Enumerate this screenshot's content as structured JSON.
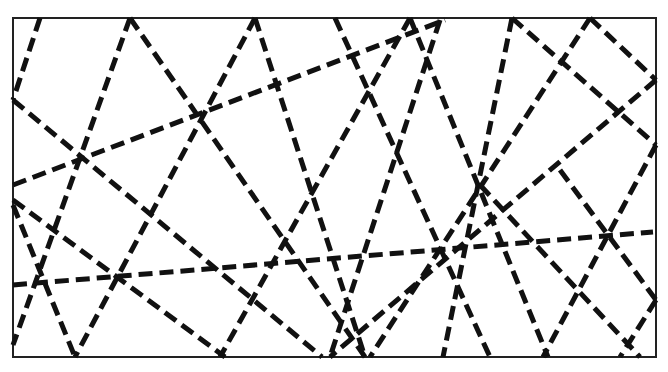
{
  "diagram": {
    "type": "line-arrangement",
    "frame": {
      "x": 13,
      "y": 18,
      "width": 643,
      "height": 339
    },
    "colors": {
      "line": "#111111",
      "frame": "#222222",
      "background": "#ffffff"
    },
    "segments": [
      [
        40,
        18,
        13,
        100
      ],
      [
        13,
        100,
        322,
        357
      ],
      [
        130,
        18,
        13,
        345
      ],
      [
        130,
        18,
        365,
        357
      ],
      [
        13,
        185,
        445,
        20
      ],
      [
        255,
        18,
        75,
        357
      ],
      [
        255,
        18,
        365,
        357
      ],
      [
        13,
        200,
        225,
        357
      ],
      [
        13,
        205,
        75,
        357
      ],
      [
        13,
        285,
        653,
        232
      ],
      [
        335,
        18,
        490,
        357
      ],
      [
        410,
        18,
        220,
        357
      ],
      [
        410,
        18,
        548,
        357
      ],
      [
        440,
        20,
        330,
        357
      ],
      [
        512,
        18,
        443,
        357
      ],
      [
        512,
        18,
        656,
        145
      ],
      [
        590,
        18,
        370,
        357
      ],
      [
        590,
        18,
        656,
        80
      ],
      [
        656,
        80,
        330,
        357
      ],
      [
        656,
        145,
        543,
        357
      ],
      [
        560,
        170,
        656,
        300
      ],
      [
        656,
        300,
        620,
        357
      ],
      [
        480,
        185,
        640,
        357
      ]
    ]
  }
}
